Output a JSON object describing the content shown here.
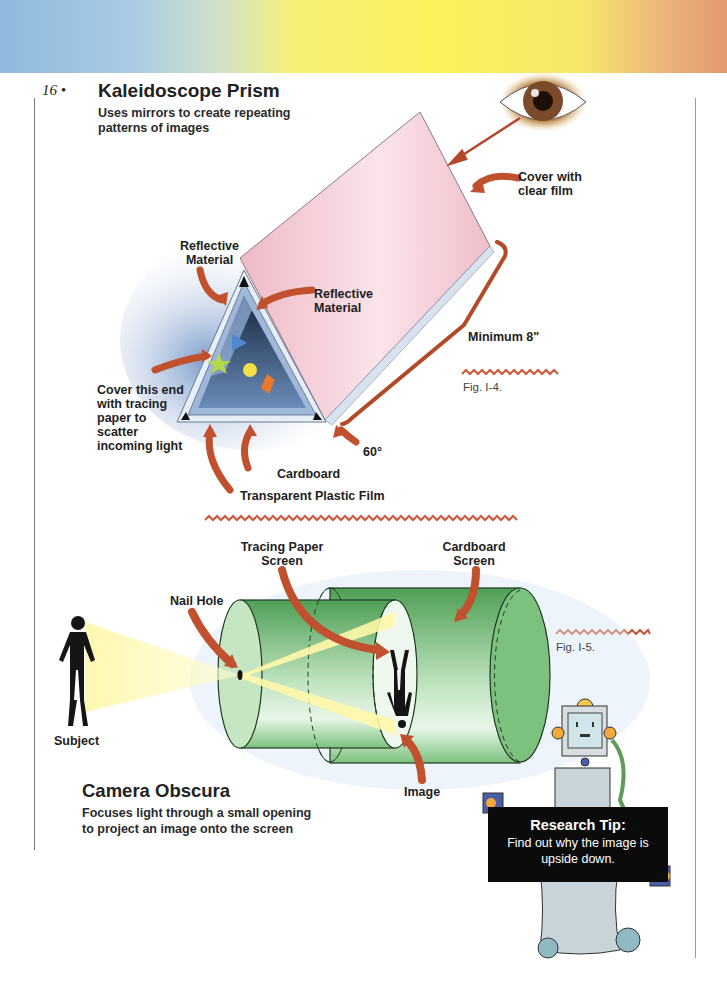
{
  "page": {
    "number": "16 •",
    "banner_colors": [
      "#8fb9dd",
      "#fbf25a",
      "#e29a6c"
    ]
  },
  "kaleidoscope": {
    "title": "Kaleidoscope Prism",
    "subtitle": "Uses mirrors to create repeating patterns of images",
    "labels": {
      "cover_clear_film": "Cover with clear film",
      "reflective_left": "Reflective Material",
      "reflective_right": "Reflective Material",
      "minimum_length": "Minimum 8\"",
      "cover_end": "Cover this end with tracing paper to scatter incoming light",
      "angle": "60°",
      "cardboard": "Cardboard",
      "transparent_film": "Transparent Plastic Film"
    },
    "figure_caption": "Fig. I-4."
  },
  "camera_obscura": {
    "title": "Camera Obscura",
    "description": "Focuses light through a small opening to project an image onto the screen",
    "labels": {
      "tracing_paper_screen": "Tracing Paper Screen",
      "cardboard_screen": "Cardboard Screen",
      "nail_hole": "Nail Hole",
      "subject": "Subject",
      "image": "Image"
    },
    "figure_caption": "Fig. I-5."
  },
  "research_tip": {
    "heading": "Research Tip:",
    "text": "Find out why the image is upside down."
  },
  "colors": {
    "arrow": "#c0502e",
    "prism_pink": "#f2c9d3",
    "prism_blue": "#2f4a73",
    "cylinder_green": "#6fb66f",
    "light_yellow": "#fff6a0",
    "squiggle": "#d0583a"
  }
}
